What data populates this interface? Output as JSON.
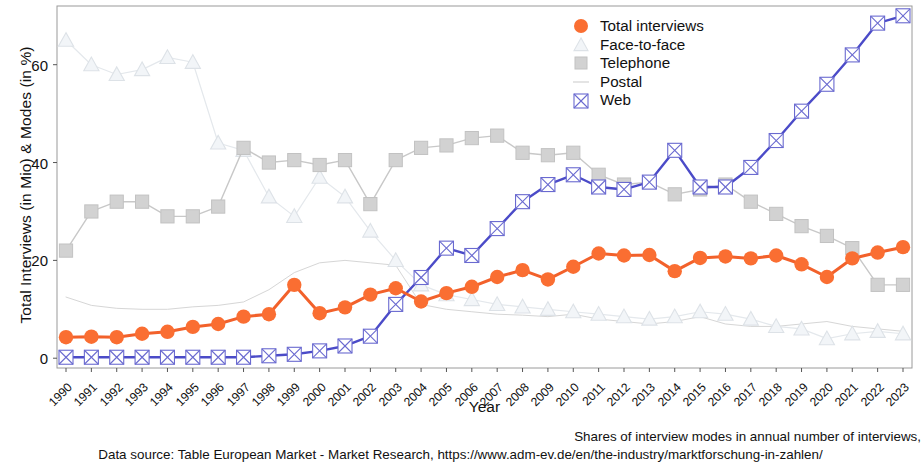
{
  "chart_data": {
    "type": "line",
    "title": "",
    "xlabel": "Year",
    "ylabel": "Total Interviews (in Mio) & Modes (in %)",
    "xlim": [
      1989.5,
      2023.5
    ],
    "ylim": [
      -2,
      72
    ],
    "yticks": [
      0,
      20,
      40,
      60
    ],
    "grid": false,
    "legend_position": "top-right",
    "categories": [
      "1990",
      "1991",
      "1992",
      "1993",
      "1994",
      "1995",
      "1996",
      "1997",
      "1998",
      "1999",
      "2000",
      "2001",
      "2002",
      "2003",
      "2004",
      "2005",
      "2006",
      "2007",
      "2008",
      "2009",
      "2010",
      "2011",
      "2012",
      "2013",
      "2014",
      "2015",
      "2016",
      "2017",
      "2018",
      "2019",
      "2020",
      "2021",
      "2022",
      "2023"
    ],
    "series": [
      {
        "name": "Total interviews",
        "marker": "circle",
        "color": "#FA6E32",
        "unit": "Mio",
        "values": [
          4.3,
          4.4,
          4.3,
          5.0,
          5.4,
          6.4,
          7.0,
          8.5,
          9.0,
          15.0,
          9.2,
          10.4,
          13.0,
          14.3,
          11.6,
          13.3,
          14.6,
          16.6,
          18.0,
          16.1,
          18.7,
          21.4,
          21.0,
          21.1,
          17.8,
          20.5,
          20.8,
          20.4,
          21.0,
          19.2,
          16.6,
          20.4,
          21.6,
          22.7
        ]
      },
      {
        "name": "Face-to-face",
        "marker": "triangle",
        "color": "#E2E6EA",
        "unit": "%",
        "values": [
          65.0,
          60.0,
          58.0,
          59.0,
          61.5,
          60.5,
          44.0,
          42.5,
          33.0,
          29.0,
          37.0,
          33.0,
          26.0,
          20.0,
          15.0,
          13.0,
          12.0,
          11.0,
          10.5,
          10.0,
          9.5,
          9.0,
          8.5,
          8.0,
          8.5,
          9.5,
          9.0,
          8.0,
          6.5,
          6.0,
          4.0,
          5.0,
          5.5,
          5.0
        ]
      },
      {
        "name": "Telephone",
        "marker": "square",
        "color": "#CFCFCF",
        "unit": "%",
        "values": [
          22.0,
          30.0,
          32.0,
          32.0,
          29.0,
          29.0,
          31.0,
          43.0,
          40.0,
          40.5,
          39.5,
          40.5,
          31.5,
          40.5,
          43.0,
          43.5,
          45.0,
          45.5,
          42.0,
          41.5,
          42.0,
          37.5,
          35.5,
          36.0,
          33.5,
          34.5,
          35.5,
          32.0,
          29.5,
          27.0,
          25.0,
          22.5,
          15.0,
          15.0
        ]
      },
      {
        "name": "Postal",
        "marker": "line",
        "color": "#DCDCDC",
        "unit": "%",
        "values": [
          12.5,
          10.8,
          10.2,
          10.0,
          10.0,
          10.5,
          10.8,
          11.5,
          14.0,
          17.5,
          19.5,
          20.0,
          19.5,
          19.0,
          11.0,
          10.0,
          9.5,
          9.0,
          8.8,
          8.5,
          9.0,
          8.0,
          7.5,
          7.0,
          7.5,
          8.5,
          7.0,
          6.5,
          6.5,
          7.0,
          7.5,
          6.5,
          6.0,
          5.5
        ]
      },
      {
        "name": "Web",
        "marker": "square-x",
        "color": "#4B4BC8",
        "unit": "%",
        "values": [
          0.2,
          0.2,
          0.2,
          0.2,
          0.2,
          0.2,
          0.2,
          0.2,
          0.5,
          0.8,
          1.5,
          2.5,
          4.5,
          11.0,
          16.5,
          22.5,
          21.0,
          26.5,
          32.0,
          35.5,
          37.5,
          35.0,
          34.5,
          36.0,
          42.5,
          35.0,
          35.0,
          39.0,
          44.5,
          50.5,
          56.0,
          62.0,
          68.5,
          70.0
        ]
      }
    ]
  },
  "legend": {
    "items": [
      {
        "label": "Total interviews",
        "key": "circle-marker",
        "color": "#FA6E32"
      },
      {
        "label": "Face-to-face",
        "key": "triangle-marker",
        "color": "#E2E6EA"
      },
      {
        "label": "Telephone",
        "key": "square-marker",
        "color": "#CFCFCF"
      },
      {
        "label": "Postal",
        "key": "line-marker",
        "color": "#DCDCDC"
      },
      {
        "label": "Web",
        "key": "square-x-marker",
        "color": "#4B4BC8"
      }
    ]
  },
  "footer": {
    "line1": "Shares of interview modes in annual number of interviews,",
    "line2": "Data source: Table European Market - Market Research, https://www.adm-ev.de/en/the-industry/marktforschung-in-zahlen/"
  }
}
